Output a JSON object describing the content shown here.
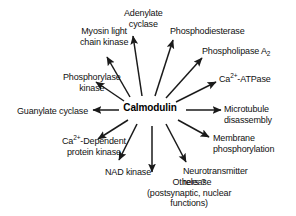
{
  "figure": {
    "type": "radial-node-diagram",
    "background_color": "#ffffff",
    "text_color": "#111111",
    "arrow_color": "#1a1a1a",
    "center": {
      "label": "Calmodulin",
      "x": 150,
      "y": 108
    }
  },
  "targets": [
    {
      "id": "adenylate-cyclase",
      "lines": [
        "Adenylate",
        "cyclase"
      ],
      "align": "center",
      "label_x": 124,
      "label_y": 8,
      "arrow": {
        "x1": 142,
        "y1": 96,
        "x2": 133,
        "y2": 36
      }
    },
    {
      "id": "phosphodiesterase",
      "lines": [
        "Phosphodiesterase"
      ],
      "align": "left",
      "label_x": 170,
      "label_y": 26,
      "arrow": {
        "x1": 155,
        "y1": 96,
        "x2": 173,
        "y2": 40
      }
    },
    {
      "id": "phospholipase-a2",
      "lines": [
        "Phospholipase A₂"
      ],
      "align": "left",
      "label_x": 202,
      "label_y": 46,
      "arrow": {
        "x1": 166,
        "y1": 98,
        "x2": 202,
        "y2": 58
      }
    },
    {
      "id": "ca-atpase",
      "lines": [
        "Ca²⁺-ATPase"
      ],
      "align": "left",
      "label_x": 219,
      "label_y": 74,
      "arrow": {
        "x1": 176,
        "y1": 102,
        "x2": 216,
        "y2": 82
      }
    },
    {
      "id": "microtubule-disassembly",
      "lines": [
        "Microtubule",
        "disassembly"
      ],
      "align": "left",
      "label_x": 224,
      "label_y": 104,
      "arrow": {
        "x1": 186,
        "y1": 110,
        "x2": 221,
        "y2": 110
      }
    },
    {
      "id": "membrane-phosphorylation",
      "lines": [
        "Membrane",
        "phosphorylation"
      ],
      "align": "left",
      "label_x": 213,
      "label_y": 133,
      "arrow": {
        "x1": 178,
        "y1": 120,
        "x2": 209,
        "y2": 137
      }
    },
    {
      "id": "neurotransmitter-release",
      "lines": [
        "Neurotransmitter",
        "release"
      ],
      "align": "left",
      "label_x": 183,
      "label_y": 166,
      "arrow": {
        "x1": 166,
        "y1": 124,
        "x2": 186,
        "y2": 162
      }
    },
    {
      "id": "others",
      "lines": [
        "Others ?",
        "(postsynaptic, nuclear",
        "functions)"
      ],
      "align": "center",
      "label_x": 147,
      "label_y": 177,
      "arrow": {
        "x1": 152,
        "y1": 126,
        "x2": 152,
        "y2": 172
      }
    },
    {
      "id": "nad-kinase",
      "lines": [
        "NAD kinase"
      ],
      "align": "center",
      "label_x": 105,
      "label_y": 167,
      "arrow": {
        "x1": 137,
        "y1": 124,
        "x2": 119,
        "y2": 160
      }
    },
    {
      "id": "ca-dependent-protein-kinase",
      "lines": [
        "Ca²⁺-Dependent",
        "protein kinase"
      ],
      "align": "center",
      "label_x": 62,
      "label_y": 136,
      "arrow": {
        "x1": 128,
        "y1": 120,
        "x2": 98,
        "y2": 139
      }
    },
    {
      "id": "guanylate-cyclase",
      "lines": [
        "Guanylate cyclase"
      ],
      "align": "right",
      "label_x": 88,
      "label_y": 106,
      "arrow": {
        "x1": 119,
        "y1": 110,
        "x2": 93,
        "y2": 110
      }
    },
    {
      "id": "phosphorylase-kinase",
      "lines": [
        "Phosphorylase",
        "kinase"
      ],
      "align": "center",
      "label_x": 63,
      "label_y": 72,
      "arrow": {
        "x1": 124,
        "y1": 101,
        "x2": 96,
        "y2": 82
      }
    },
    {
      "id": "myosin-light-chain-kinase",
      "lines": [
        "Myosin light",
        "chain kinase"
      ],
      "align": "center",
      "label_x": 80,
      "label_y": 26,
      "arrow": {
        "x1": 130,
        "y1": 97,
        "x2": 107,
        "y2": 57
      }
    }
  ]
}
